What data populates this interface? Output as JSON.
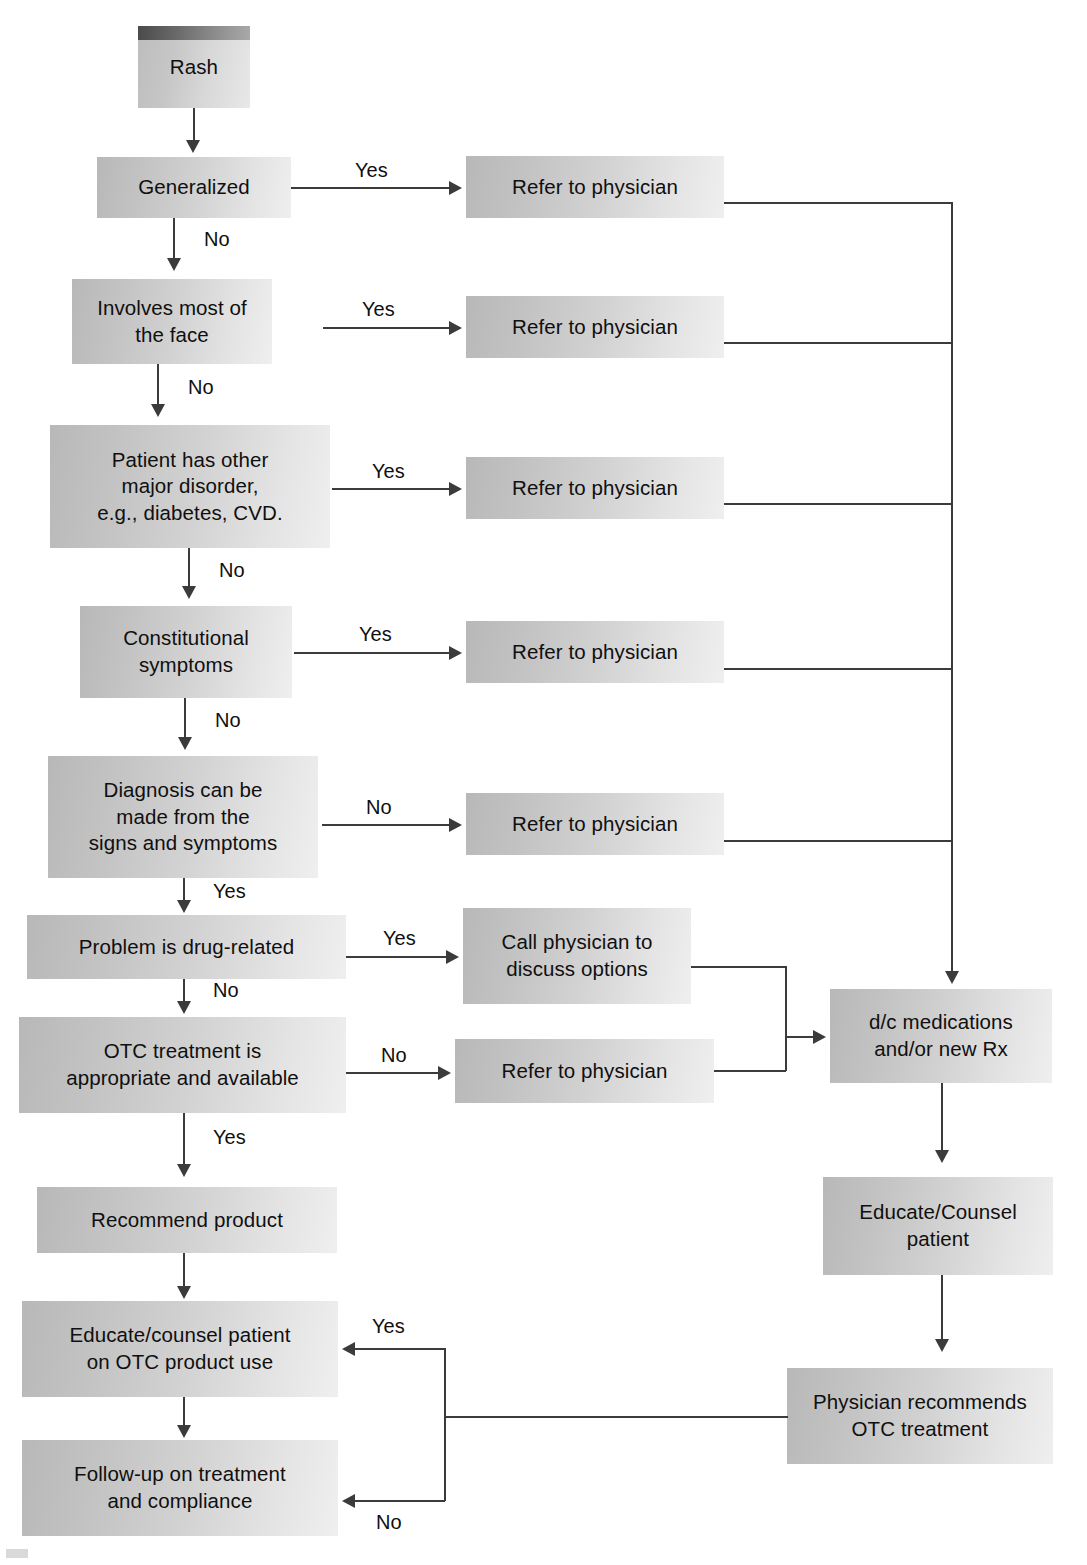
{
  "diagram": {
    "theme": {
      "box_fill_dark": "#b8b8b8",
      "box_fill_light": "#efefef",
      "line_color": "#3b3b3b",
      "text_color": "#100f0f",
      "page_background": "#ffffff"
    },
    "nodes": [
      {
        "id": "rash",
        "label": "Rash"
      },
      {
        "id": "generalized",
        "label": "Generalized"
      },
      {
        "id": "refer1",
        "label": "Refer to physician"
      },
      {
        "id": "face",
        "label": "Involves most of\nthe face"
      },
      {
        "id": "refer2",
        "label": "Refer to physician"
      },
      {
        "id": "major_disorder",
        "label": "Patient has other\nmajor disorder,\ne.g., diabetes, CVD."
      },
      {
        "id": "refer3",
        "label": "Refer to physician"
      },
      {
        "id": "constitutional",
        "label": "Constitutional\nsymptoms"
      },
      {
        "id": "refer4",
        "label": "Refer to physician"
      },
      {
        "id": "diagnosis",
        "label": "Diagnosis can be\nmade from the\nsigns and symptoms"
      },
      {
        "id": "refer5",
        "label": "Refer to physician"
      },
      {
        "id": "drug_related",
        "label": "Problem is drug-related"
      },
      {
        "id": "call_physician",
        "label": "Call physician to\ndiscuss options"
      },
      {
        "id": "otc_appropriate",
        "label": "OTC treatment is\nappropriate and available"
      },
      {
        "id": "refer6",
        "label": "Refer to physician"
      },
      {
        "id": "dc_meds",
        "label": "d/c medications\nand/or new Rx"
      },
      {
        "id": "recommend_product",
        "label": "Recommend product"
      },
      {
        "id": "educate_counsel_rx",
        "label": "Educate/Counsel\npatient"
      },
      {
        "id": "educate_otc",
        "label": "Educate/counsel patient\non OTC product use"
      },
      {
        "id": "physician_otc",
        "label": "Physician recommends\nOTC treatment"
      },
      {
        "id": "follow_up",
        "label": "Follow-up on treatment\nand compliance"
      }
    ],
    "edge_labels": {
      "generalized_yes": "Yes",
      "generalized_no": "No",
      "face_yes": "Yes",
      "face_no": "No",
      "major_yes": "Yes",
      "major_no": "No",
      "constitutional_yes": "Yes",
      "constitutional_no": "No",
      "diagnosis_no": "No",
      "diagnosis_yes": "Yes",
      "drug_yes": "Yes",
      "drug_no": "No",
      "otc_no": "No",
      "otc_yes": "Yes",
      "physician_otc_yes": "Yes",
      "physician_otc_no": "No"
    }
  }
}
